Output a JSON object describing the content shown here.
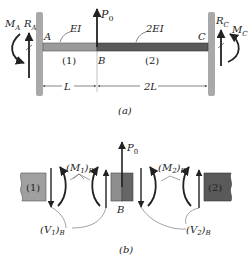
{
  "panel_a": {
    "caption": "(a)",
    "left_moment": "M",
    "left_moment_sub": "A",
    "left_reaction": "R",
    "left_reaction_sub": "A",
    "right_moment": "M",
    "right_moment_sub": "C",
    "right_reaction": "R",
    "right_reaction_sub": "C",
    "point_a": "A",
    "point_b": "B",
    "point_c": "C",
    "load": "P",
    "load_sub": "0",
    "stiffness_1": "EI",
    "stiffness_2": "2EI",
    "segment_1": "(1)",
    "segment_2": "(2)",
    "length_1": "L",
    "length_2": "2L"
  },
  "panel_b": {
    "caption": "(b)",
    "segment_1": "(1)",
    "segment_2": "(2)",
    "joint": "B",
    "load": "P",
    "load_sub": "0",
    "moment_1": "(M",
    "moment_1_sub": "1",
    "moment_1_close": ")",
    "moment_1_loc": "B",
    "moment_2": "(M",
    "moment_2_sub": "2",
    "moment_2_close": ")",
    "moment_2_loc": "B",
    "shear_1": "(V",
    "shear_1_sub": "1",
    "shear_1_close": ")",
    "shear_1_loc": "B",
    "shear_2": "(V",
    "shear_2_sub": "2",
    "shear_2_close": ")",
    "shear_2_loc": "B"
  },
  "colors": {
    "wall": "#a9a9a9",
    "beam_1": "#9a9a9a",
    "beam_2": "#5a5a5a",
    "ink": "#222222"
  }
}
